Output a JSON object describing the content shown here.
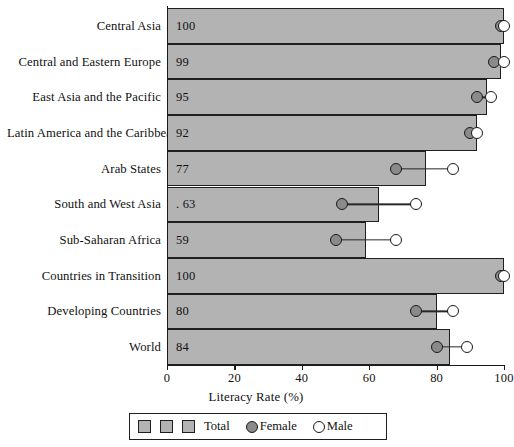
{
  "chart_data": {
    "type": "bar",
    "title": "",
    "xlabel": "Literacy Rate (%)",
    "ylabel": "",
    "xlim": [
      0,
      100
    ],
    "xticks": [
      0,
      20,
      40,
      60,
      80,
      100
    ],
    "grid": false,
    "orientation": "horizontal",
    "legend_position": "bottom",
    "categories": [
      "Central Asia",
      "Central and Eastern Europe",
      "East Asia and the Pacific",
      "Latin America and the Caribbean",
      "Arab States",
      "South and West Asia",
      "Sub-Saharan Africa",
      "Countries in Transition",
      "Developing Countries",
      "World"
    ],
    "series": [
      {
        "name": "Total",
        "marker": "bar",
        "values": [
          100,
          99,
          95,
          92,
          77,
          63,
          59,
          100,
          80,
          84
        ]
      },
      {
        "name": "Female",
        "marker": "filled-circle",
        "values": [
          99,
          97,
          92,
          90,
          68,
          52,
          50,
          99,
          74,
          80
        ]
      },
      {
        "name": "Male",
        "marker": "open-circle",
        "values": [
          100,
          100,
          96,
          92,
          85,
          74,
          68,
          100,
          85,
          89
        ]
      }
    ],
    "bar_labels": [
      "100",
      "99",
      "95",
      "92",
      "77",
      ". 63",
      "59",
      "100",
      "80",
      "84"
    ],
    "legend": {
      "swatch_count": 3,
      "total_label": "Total",
      "female_label": "Female",
      "male_label": "Male"
    },
    "colors": {
      "bar_fill": "#b3b3b3",
      "bar_stroke": "#1f1f1f",
      "female_fill": "#8a8a8a",
      "male_fill": "#ffffff",
      "marker_stroke": "#1a1a1a",
      "axis": "#1a1a1a",
      "background": "#ffffff"
    }
  }
}
